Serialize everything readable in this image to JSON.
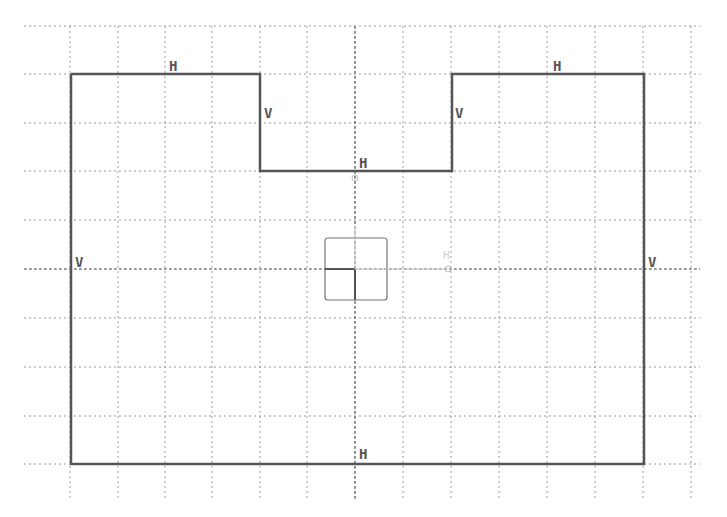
{
  "sketch": {
    "grid": {
      "columns_x": [
        70,
        118,
        165,
        212,
        260,
        307,
        355,
        403,
        451,
        499,
        547,
        595,
        643,
        691
      ],
      "rows_y": [
        26,
        74,
        123,
        171,
        220,
        269,
        318,
        367,
        416,
        464
      ],
      "extent": {
        "x_min": 24,
        "x_max": 700,
        "y_min": 26,
        "y_max": 500
      },
      "color": "#9a9a9a"
    },
    "axes": {
      "origin": [
        355,
        269
      ],
      "color": "#6a6a6a"
    },
    "profile": {
      "color": "#555555",
      "points": [
        [
          71,
          74
        ],
        [
          260,
          74
        ],
        [
          260,
          171
        ],
        [
          452,
          171
        ],
        [
          452,
          74
        ],
        [
          644,
          74
        ],
        [
          644,
          464
        ],
        [
          71,
          464
        ]
      ]
    },
    "constraints": [
      {
        "label": "H",
        "x": 169,
        "y": 59
      },
      {
        "label": "V",
        "x": 264,
        "y": 106
      },
      {
        "label": "V",
        "x": 455,
        "y": 106
      },
      {
        "label": "H",
        "x": 553,
        "y": 59
      },
      {
        "label": "H",
        "x": 359,
        "y": 156
      },
      {
        "label": "V",
        "x": 75,
        "y": 255
      },
      {
        "label": "V",
        "x": 648,
        "y": 255
      },
      {
        "label": "H",
        "x": 359,
        "y": 447
      }
    ],
    "origin_marker": {
      "box": {
        "x": 325,
        "y": 238,
        "w": 62,
        "h": 62
      },
      "ghost_label": "H",
      "ghost_label_pos": [
        443,
        250
      ],
      "endpoint": [
        448,
        269
      ]
    },
    "center_point": [
      355,
      178
    ]
  }
}
